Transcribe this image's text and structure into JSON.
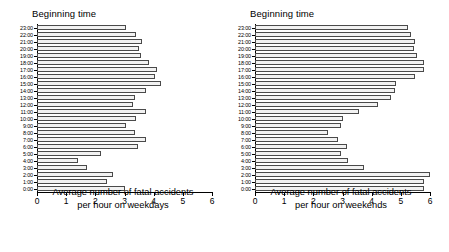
{
  "chart_data": [
    {
      "type": "bar",
      "orientation": "horizontal",
      "title": "Beginning time",
      "xlabel": "Average number of fatal accidents per hour on weekdays",
      "ylabel": "Beginning time",
      "xlim": [
        0,
        6
      ],
      "xticks": [
        0,
        1,
        2,
        3,
        4,
        5,
        6
      ],
      "grid": false,
      "legend": null,
      "categories": [
        "23:00",
        "22:00",
        "21:00",
        "20:00",
        "19:00",
        "18:00",
        "17:00",
        "16:00",
        "15:00",
        "14:00",
        "13:00",
        "12:00",
        "11:00",
        "10:00",
        "9:00",
        "8:00",
        "7:00",
        "6:00",
        "5:00",
        "4:00",
        "3:00",
        "2:00",
        "1:00",
        "0:00"
      ],
      "values": [
        3.05,
        3.4,
        3.6,
        3.5,
        3.55,
        3.85,
        4.1,
        4.05,
        4.25,
        3.75,
        3.35,
        3.3,
        3.75,
        3.4,
        3.05,
        3.35,
        3.75,
        3.45,
        2.2,
        1.4,
        1.7,
        2.6,
        2.4,
        3.0
      ]
    },
    {
      "type": "bar",
      "orientation": "horizontal",
      "title": "Beginning time",
      "xlabel": "Average number of fatal accidents per hour on weekends",
      "ylabel": "Beginning time",
      "xlim": [
        0,
        6
      ],
      "xticks": [
        0,
        1,
        2,
        3,
        4,
        5,
        6
      ],
      "grid": false,
      "legend": null,
      "categories": [
        "23:00",
        "22:00",
        "21:00",
        "20:00",
        "19:00",
        "18:00",
        "17:00",
        "16:00",
        "15:00",
        "14:00",
        "13:00",
        "12:00",
        "11:00",
        "10:00",
        "9:00",
        "8:00",
        "7:00",
        "6:00",
        "5:00",
        "4:00",
        "3:00",
        "2:00",
        "1:00",
        "0:00"
      ],
      "values": [
        5.25,
        5.35,
        5.5,
        5.45,
        5.55,
        5.8,
        5.8,
        5.5,
        4.85,
        4.8,
        4.65,
        4.2,
        3.55,
        3.0,
        2.95,
        2.5,
        2.85,
        3.15,
        2.95,
        3.2,
        3.75,
        6.05,
        5.8,
        5.8
      ]
    }
  ],
  "panels": [
    {
      "title": "Beginning time",
      "xtitle_line1": "Average number of fatal accidents",
      "xtitle_line2": "per hour on weekdays"
    },
    {
      "title": "Beginning time",
      "xtitle_line1": "Average number of fatal accidents",
      "xtitle_line2": "per hour on weekends"
    }
  ],
  "colors": {
    "bar_fill": "#f2f2f2",
    "bar_stroke": "#4a4a4a",
    "axis": "#000000",
    "text": "#000000",
    "background": "#ffffff"
  }
}
